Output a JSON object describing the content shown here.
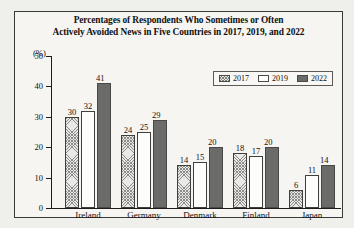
{
  "figure": {
    "title_line1": "Percentages of Respondents Who Sometimes or Often",
    "title_line2": "Actively Avoided News in Five Countries in 2017, 2019, and 2022",
    "unit_label": "(%)"
  },
  "legend": {
    "items": [
      {
        "label": "2017",
        "swatch": "hatched-crosshatch",
        "color": "#e8e8e6"
      },
      {
        "label": "2019",
        "swatch": "white-empty",
        "color": "#ffffff"
      },
      {
        "label": "2022",
        "swatch": "solid-dark-gray",
        "color": "#6b6b69"
      }
    ]
  },
  "axis": {
    "y_ticks": [
      "0",
      "10",
      "20",
      "30",
      "40",
      "50"
    ]
  },
  "chart_data": {
    "type": "bar",
    "title": "Percentages of Respondents Who Sometimes or Often Actively Avoided News in Five Countries in 2017, 2019, and 2022",
    "xlabel": "",
    "ylabel": "(%)",
    "ylim": [
      0,
      50
    ],
    "yticks": [
      0,
      10,
      20,
      30,
      40,
      50
    ],
    "grid": false,
    "legend_position": "top-right",
    "categories": [
      "Ireland",
      "Germany",
      "Denmark",
      "Finland",
      "Japan"
    ],
    "series": [
      {
        "name": "2017",
        "values": [
          30,
          24,
          14,
          18,
          6
        ]
      },
      {
        "name": "2019",
        "values": [
          32,
          25,
          15,
          17,
          11
        ]
      },
      {
        "name": "2022",
        "values": [
          41,
          29,
          20,
          20,
          14
        ]
      }
    ]
  }
}
